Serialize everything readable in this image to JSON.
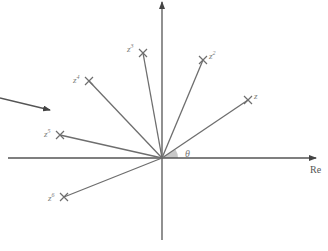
{
  "diagram": {
    "colors": {
      "line": "#6e6e6e",
      "axis": "#555555",
      "wedge": "#c8c8c8",
      "label": "#7a7a7a"
    },
    "axes": {
      "horizontal_label": "Re",
      "vertical_label": ""
    },
    "angle_label": "θ",
    "points": [
      {
        "base": "z",
        "exp": ""
      },
      {
        "base": "z",
        "exp": "2"
      },
      {
        "base": "z",
        "exp": "3"
      },
      {
        "base": "z",
        "exp": "4"
      },
      {
        "base": "z",
        "exp": "5"
      },
      {
        "base": "z",
        "exp": "6"
      }
    ]
  }
}
